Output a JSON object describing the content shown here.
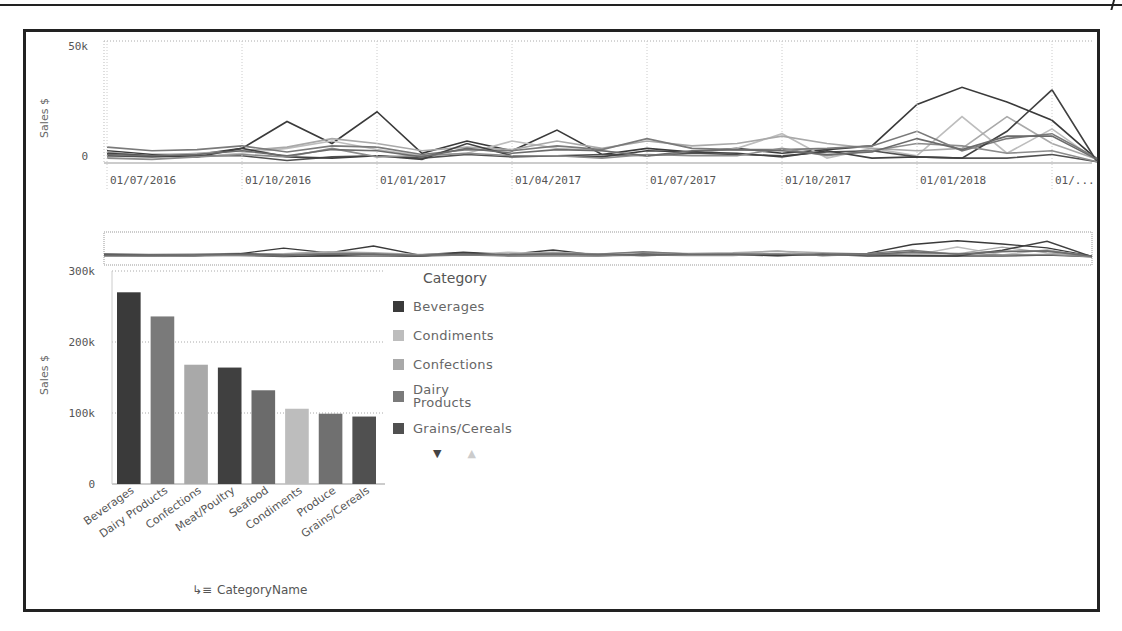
{
  "line_chart": {
    "y_axis_label": "Sales $",
    "y_ticks": [
      "0",
      "50k"
    ],
    "x_ticks": [
      "01/07/2016",
      "01/10/2016",
      "01/01/2017",
      "01/04/2017",
      "01/07/2017",
      "01/10/2017",
      "01/01/2018",
      "01/..."
    ]
  },
  "bar_chart": {
    "y_axis_label": "Sales $",
    "y_ticks": [
      "0",
      "100k",
      "200k",
      "300k"
    ],
    "dimension_label": "CategoryName"
  },
  "legend": {
    "title": "Category",
    "items": [
      {
        "label": "Beverages",
        "color": "#3a3a3a"
      },
      {
        "label": "Condiments",
        "color": "#bdbdbd"
      },
      {
        "label": "Confections",
        "color": "#a9a9a9"
      },
      {
        "label": "Dairy Products",
        "color": "#7a7a7a"
      },
      {
        "label": "Grains/Cereals",
        "color": "#505050"
      }
    ],
    "nav": {
      "down": "▼",
      "up": "▲"
    }
  },
  "chart_data": [
    {
      "type": "line",
      "title": "",
      "xlabel": "",
      "ylabel": "Sales $",
      "ylim": [
        0,
        50000
      ],
      "grid": true,
      "legend_position": "none",
      "x": [
        "2016-07",
        "2016-08",
        "2016-09",
        "2016-10",
        "2016-11",
        "2016-12",
        "2017-01",
        "2017-02",
        "2017-03",
        "2017-04",
        "2017-05",
        "2017-06",
        "2017-07",
        "2017-08",
        "2017-09",
        "2017-10",
        "2017-11",
        "2017-12",
        "2018-01",
        "2018-02",
        "2018-03",
        "2018-04",
        "2018-05"
      ],
      "x_tick_labels": [
        "01/07/2016",
        "01/10/2016",
        "01/01/2017",
        "01/04/2017",
        "01/07/2017",
        "01/10/2017",
        "01/01/2018",
        "01/..."
      ],
      "series": [
        {
          "name": "Beverages",
          "color": "#3a3a3a",
          "values": [
            5000,
            3500,
            3500,
            6000,
            17000,
            8000,
            21000,
            4000,
            9000,
            5000,
            13500,
            3500,
            6000,
            4500,
            6000,
            4000,
            5500,
            7000,
            24000,
            31000,
            25000,
            17500,
            1500
          ]
        },
        {
          "name": "Condiments",
          "color": "#bdbdbd",
          "values": [
            2500,
            3000,
            2500,
            4000,
            6000,
            9000,
            5500,
            3000,
            4000,
            9000,
            6000,
            5000,
            3000,
            4000,
            6000,
            12000,
            2000,
            6000,
            3000,
            19000,
            4000,
            14000,
            1000
          ]
        },
        {
          "name": "Confections",
          "color": "#a9a9a9",
          "values": [
            4500,
            3000,
            4000,
            5000,
            6500,
            10000,
            8000,
            5000,
            6500,
            5500,
            9000,
            6000,
            9000,
            7000,
            8000,
            11000,
            8000,
            6000,
            5000,
            6000,
            19000,
            8000,
            1500
          ]
        },
        {
          "name": "Dairy Products",
          "color": "#7a7a7a",
          "values": [
            6500,
            5000,
            5500,
            7000,
            4500,
            7000,
            6500,
            3500,
            5500,
            5000,
            7000,
            5500,
            10000,
            6000,
            5500,
            5500,
            6000,
            7000,
            13000,
            5000,
            10000,
            12000,
            2000
          ]
        },
        {
          "name": "Grains/Cereals",
          "color": "#505050",
          "values": [
            3000,
            2500,
            3000,
            3000,
            1000,
            2500,
            3000,
            2000,
            3500,
            2500,
            3000,
            3500,
            3000,
            4000,
            3500,
            3000,
            4500,
            5000,
            2500,
            2000,
            2000,
            3500,
            500
          ]
        },
        {
          "name": "Meat/Poultry",
          "color": "#404040",
          "values": [
            4000,
            3000,
            2500,
            6000,
            2500,
            2000,
            3000,
            1500,
            8000,
            3000,
            3000,
            2500,
            5000,
            4500,
            4000,
            2500,
            5000,
            2000,
            2500,
            2000,
            13000,
            30000,
            500
          ]
        },
        {
          "name": "Produce",
          "color": "#8c8c8c",
          "values": [
            2000,
            1500,
            2500,
            3500,
            2500,
            6000,
            2500,
            3000,
            4000,
            3000,
            3000,
            2000,
            3500,
            3000,
            3000,
            6000,
            3000,
            5000,
            8000,
            7000,
            4000,
            5000,
            500
          ]
        },
        {
          "name": "Seafood",
          "color": "#6b6b6b",
          "values": [
            3500,
            3000,
            3500,
            5000,
            3000,
            5500,
            5000,
            2500,
            6000,
            4000,
            5500,
            5000,
            3000,
            5000,
            5500,
            5000,
            3500,
            4500,
            10000,
            5500,
            11000,
            11000,
            1500
          ]
        }
      ]
    },
    {
      "type": "bar",
      "title": "",
      "xlabel": "CategoryName",
      "ylabel": "Sales $",
      "ylim": [
        0,
        300000
      ],
      "grid": true,
      "legend_position": "right",
      "categories": [
        "Beverages",
        "Dairy Products",
        "Confections",
        "Meat/Poultry",
        "Seafood",
        "Condiments",
        "Produce",
        "Grains/Cereals"
      ],
      "values": [
        270000,
        236000,
        168000,
        164000,
        132000,
        106000,
        99000,
        95000
      ],
      "colors": [
        "#3a3a3a",
        "#7a7a7a",
        "#a9a9a9",
        "#404040",
        "#6b6b6b",
        "#bdbdbd",
        "#707070",
        "#505050"
      ],
      "y_tick_labels": [
        "0",
        "100k",
        "200k",
        "300k"
      ]
    }
  ]
}
